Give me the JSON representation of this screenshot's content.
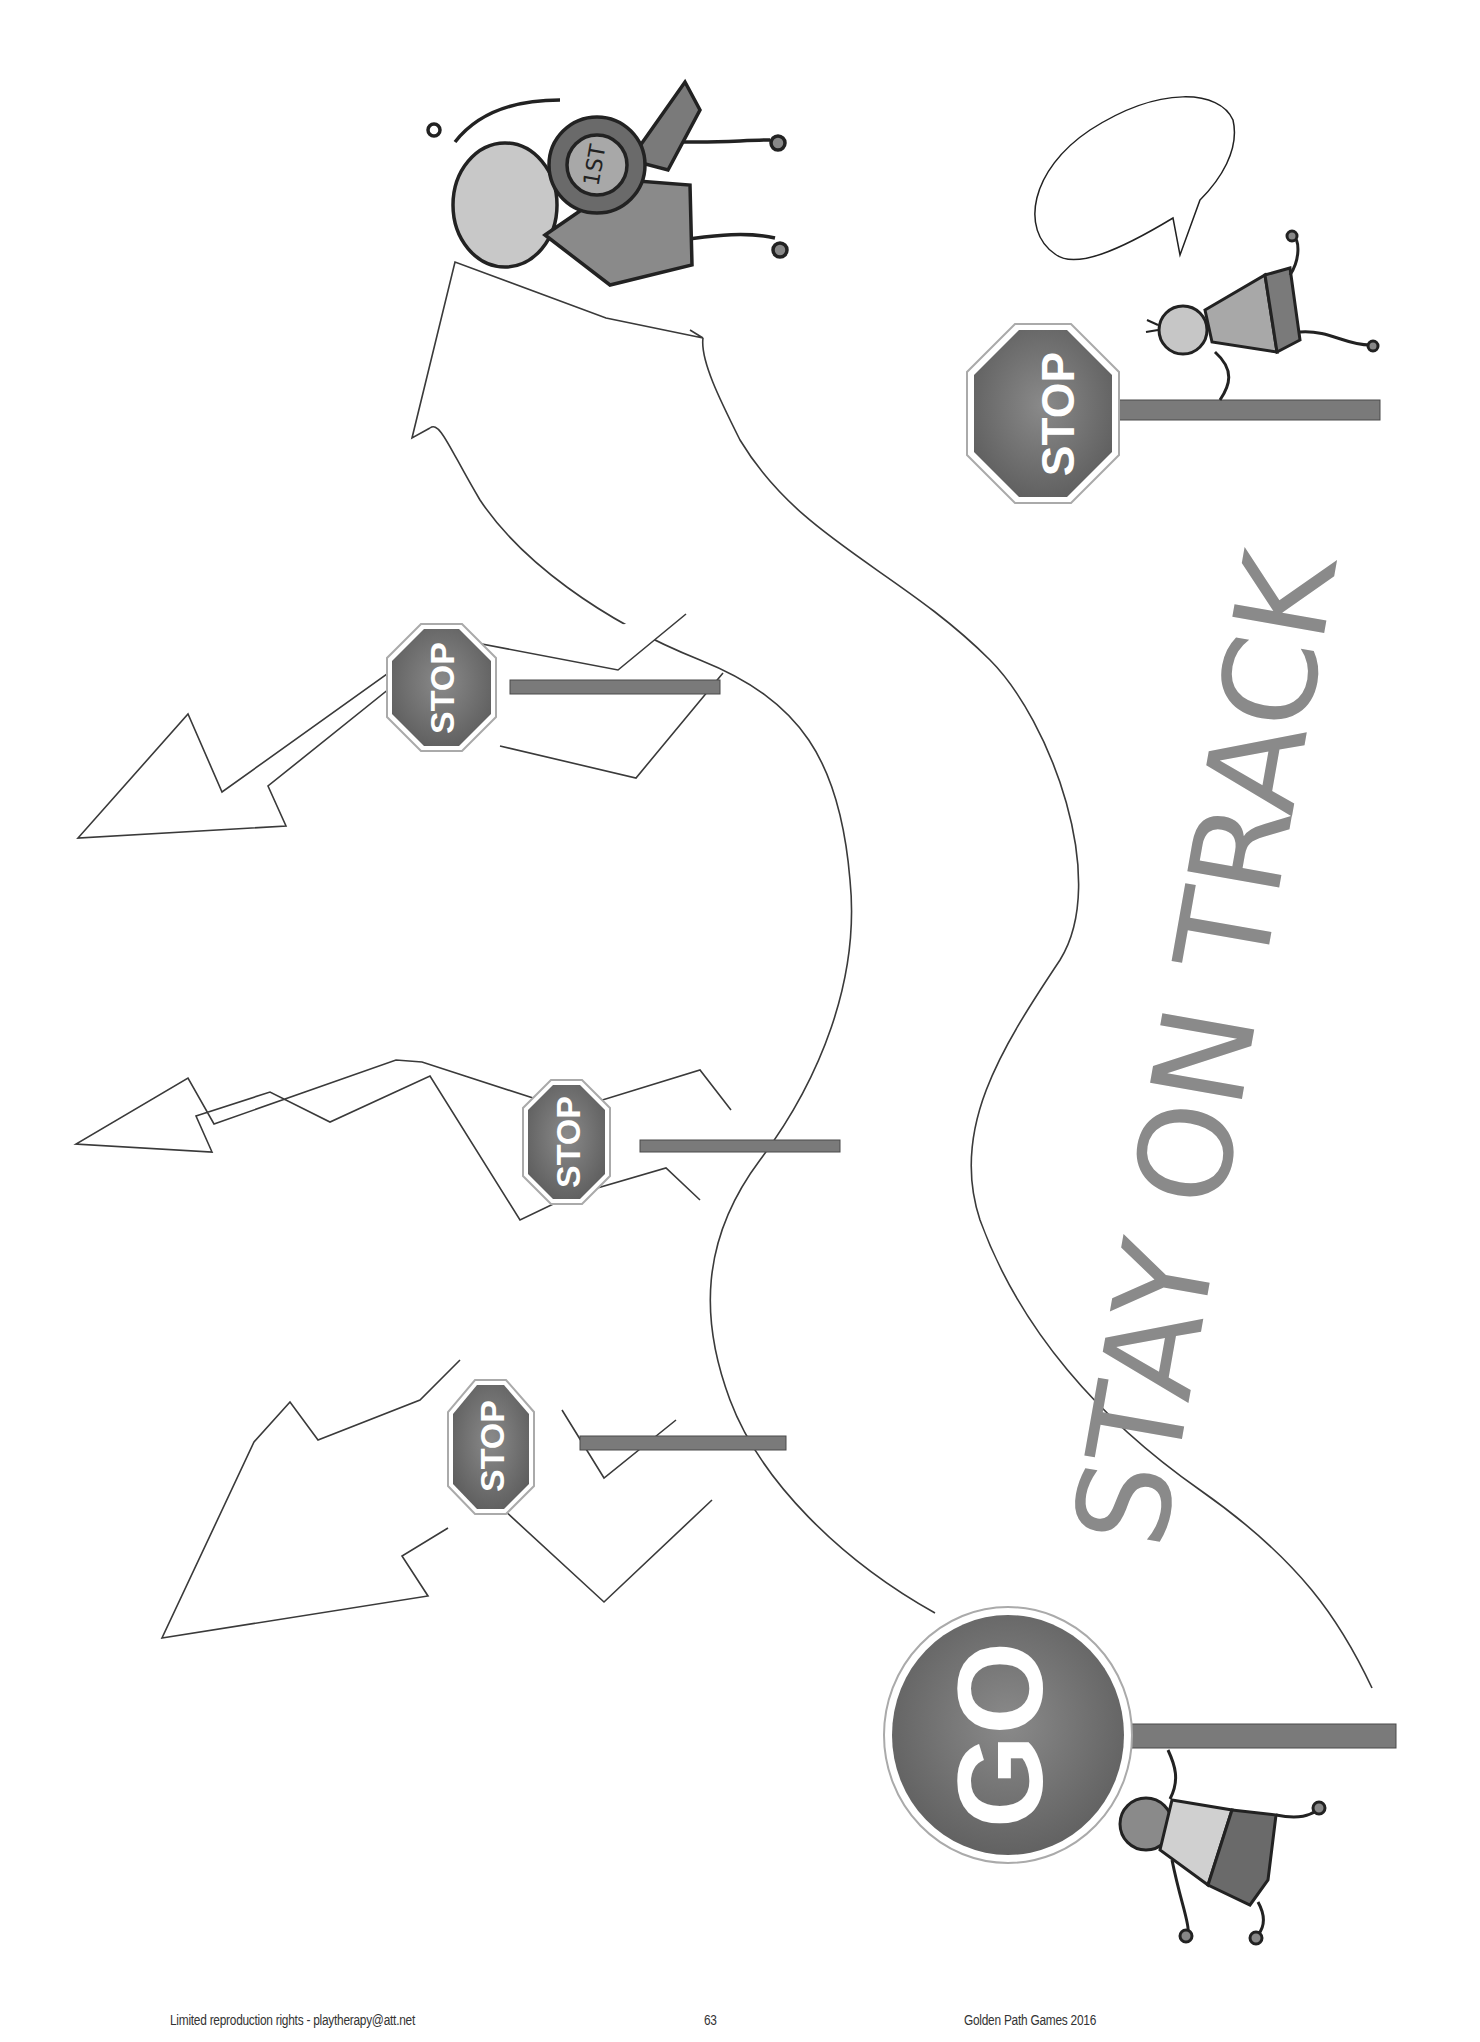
{
  "page": {
    "title_text": "STAY ON TRACK",
    "footer": {
      "left": "Limited reproduction rights  - playtherapy@att.net",
      "center": "63",
      "right": "Golden Path Games 2016"
    }
  },
  "signs": {
    "go": {
      "label": "GO"
    },
    "stop_top_right": {
      "label": "STOP"
    },
    "stop_upper": {
      "label": "STOP"
    },
    "stop_middle": {
      "label": "STOP"
    },
    "stop_lower": {
      "label": "STOP"
    }
  },
  "characters": {
    "winner": {
      "badge": "1ST"
    },
    "speech_bubble": {
      "text": ""
    }
  },
  "colors": {
    "sign_fill": "#6e6e6e",
    "pole": "#7a7a7a",
    "title": "#8a8a8a",
    "outline": "#3a3a3a",
    "background": "#ffffff"
  }
}
